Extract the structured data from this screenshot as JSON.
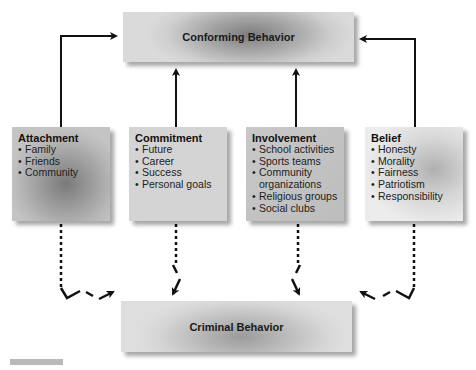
{
  "diagram": {
    "outcomes": {
      "conforming": "Conforming Behavior",
      "criminal": "Criminal Behavior"
    },
    "factors": [
      {
        "title": "Attachment",
        "items": [
          "Family",
          "Friends",
          "Community"
        ]
      },
      {
        "title": "Commitment",
        "items": [
          "Future",
          "Career",
          "Success",
          "Personal goals"
        ]
      },
      {
        "title": "Involvement",
        "items": [
          "School activities",
          "Sports teams",
          "Community organizations",
          "Religious groups",
          "Social clubs"
        ]
      },
      {
        "title": "Belief",
        "items": [
          "Honesty",
          "Morality",
          "Fairness",
          "Patriotism",
          "Responsibility"
        ]
      }
    ],
    "connectors": {
      "solid": "factor leads to Conforming Behavior",
      "dashed": "weak factor leads to Criminal Behavior"
    }
  }
}
